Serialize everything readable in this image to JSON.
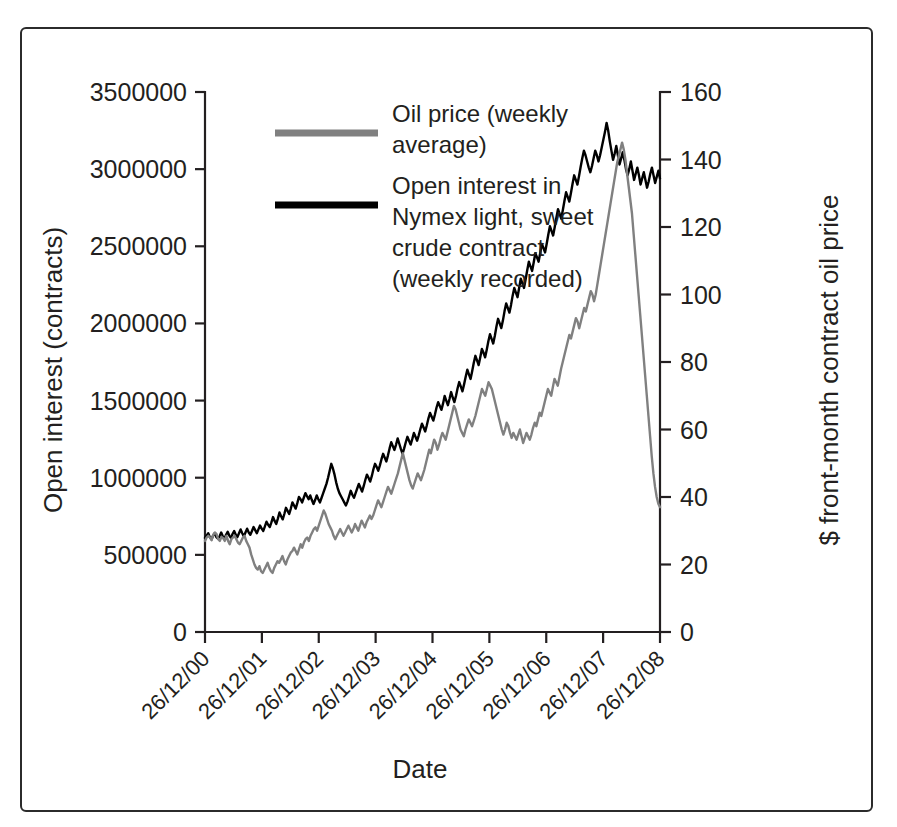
{
  "figure": {
    "background_color": "#ffffff",
    "border_color": "#2b2b2b"
  },
  "chart_data": {
    "type": "line",
    "title": "",
    "xlabel": "Date",
    "ylabel": "Open interest (contracts)",
    "y2label": "$ front-month contract oil price",
    "grid": false,
    "legend_position": "top-center",
    "x_tick_labels": [
      "26/12/00",
      "26/12/01",
      "26/12/02",
      "26/12/03",
      "26/12/04",
      "26/12/05",
      "26/12/06",
      "26/12/07",
      "26/12/08"
    ],
    "x_tick_rotation": -45,
    "xlim": [
      0,
      8
    ],
    "ylim": [
      0,
      3500000
    ],
    "y_ticks": [
      0,
      500000,
      1000000,
      1500000,
      2000000,
      2500000,
      3000000,
      3500000
    ],
    "y_tick_labels": [
      "0",
      "500000",
      "1000000",
      "1500000",
      "2000000",
      "2500000",
      "3000000",
      "3500000"
    ],
    "y2lim": [
      0,
      160
    ],
    "y2_ticks": [
      0,
      20,
      40,
      60,
      80,
      100,
      120,
      140,
      160
    ],
    "y2_tick_labels": [
      "0",
      "20",
      "40",
      "60",
      "80",
      "100",
      "120",
      "140",
      "160"
    ],
    "series": [
      {
        "name": "Oil price (weekly average)",
        "legend_label_lines": [
          "Oil price (weekly",
          "average)"
        ],
        "color": "#808080",
        "axis": "right",
        "units": "$ per barrel",
        "values": [
          27.0,
          28.0,
          28.5,
          28.0,
          27.2,
          28.8,
          29.5,
          29.0,
          27.5,
          27.0,
          28.2,
          27.8,
          27.0,
          28.5,
          27.0,
          26.0,
          27.5,
          28.0,
          28.5,
          27.5,
          26.5,
          26.0,
          27.0,
          28.0,
          28.5,
          27.0,
          26.0,
          25.0,
          23.0,
          21.5,
          20.0,
          19.0,
          18.5,
          19.5,
          18.0,
          17.5,
          18.5,
          19.5,
          20.5,
          19.0,
          18.0,
          17.5,
          19.0,
          20.0,
          21.0,
          20.5,
          21.5,
          22.5,
          21.0,
          20.0,
          21.5,
          22.5,
          23.5,
          24.0,
          25.0,
          24.0,
          23.0,
          24.5,
          26.0,
          25.0,
          26.5,
          27.5,
          28.0,
          27.0,
          28.5,
          29.5,
          30.5,
          31.0,
          30.0,
          31.5,
          33.0,
          34.5,
          36.0,
          35.0,
          33.5,
          32.0,
          31.0,
          30.0,
          28.5,
          27.5,
          28.5,
          29.5,
          30.5,
          29.5,
          28.5,
          29.5,
          30.5,
          31.5,
          30.5,
          29.5,
          30.5,
          32.0,
          31.0,
          30.0,
          31.5,
          33.0,
          32.0,
          31.0,
          32.5,
          33.5,
          34.5,
          33.5,
          34.5,
          36.0,
          37.5,
          39.0,
          38.0,
          37.0,
          38.5,
          40.0,
          41.5,
          43.0,
          42.0,
          41.0,
          42.5,
          44.0,
          45.5,
          47.0,
          49.0,
          51.0,
          53.0,
          51.0,
          49.0,
          47.0,
          45.0,
          43.5,
          42.5,
          44.0,
          45.5,
          47.0,
          46.0,
          45.0,
          46.5,
          48.0,
          50.0,
          52.0,
          54.0,
          53.0,
          55.0,
          57.0,
          56.0,
          54.0,
          55.5,
          57.5,
          59.0,
          58.0,
          57.0,
          59.0,
          61.0,
          63.0,
          65.0,
          67.0,
          66.0,
          64.0,
          62.0,
          60.0,
          59.0,
          58.0,
          60.0,
          61.5,
          63.0,
          62.0,
          61.0,
          62.5,
          64.0,
          66.0,
          68.0,
          70.0,
          72.0,
          71.0,
          70.0,
          72.0,
          74.0,
          73.0,
          72.0,
          70.0,
          68.0,
          66.0,
          64.0,
          62.0,
          60.0,
          58.5,
          60.0,
          62.0,
          61.0,
          59.0,
          57.5,
          59.0,
          58.0,
          57.0,
          58.5,
          60.0,
          58.0,
          56.0,
          57.5,
          59.0,
          58.0,
          57.0,
          58.5,
          60.5,
          62.0,
          61.0,
          63.0,
          65.0,
          64.0,
          66.0,
          68.0,
          70.0,
          72.0,
          71.0,
          70.0,
          72.5,
          75.0,
          74.0,
          73.0,
          75.5,
          78.0,
          80.0,
          82.0,
          84.0,
          86.0,
          88.0,
          87.0,
          89.0,
          91.0,
          93.0,
          92.0,
          90.0,
          92.0,
          94.0,
          96.0,
          95.0,
          97.0,
          99.0,
          101.0,
          100.0,
          98.0,
          100.0,
          103.0,
          106.0,
          109.0,
          112.0,
          115.0,
          118.0,
          121.0,
          124.0,
          127.0,
          130.0,
          133.0,
          136.0,
          139.0,
          141.0,
          143.0,
          145.0,
          143.0,
          140.0,
          136.0,
          132.0,
          128.0,
          124.0,
          118.0,
          112.0,
          106.0,
          100.0,
          94.0,
          88.0,
          82.0,
          76.0,
          70.0,
          64.0,
          58.0,
          52.0,
          47.0,
          43.0,
          40.0,
          38.0,
          37.0
        ]
      },
      {
        "name": "Open interest in Nymex light, sweet crude contract (weekly recorded)",
        "legend_label_lines": [
          "Open interest in",
          "Nymex light, sweet",
          "crude contract",
          "(weekly recorded)"
        ],
        "color": "#000000",
        "axis": "left",
        "units": "contracts",
        "values": [
          610000,
          625000,
          640000,
          615000,
          600000,
          625000,
          640000,
          615000,
          605000,
          620000,
          645000,
          620000,
          605000,
          630000,
          650000,
          625000,
          610000,
          635000,
          655000,
          630000,
          615000,
          640000,
          665000,
          640000,
          620000,
          645000,
          670000,
          645000,
          630000,
          655000,
          680000,
          660000,
          640000,
          665000,
          690000,
          670000,
          655000,
          685000,
          715000,
          695000,
          680000,
          710000,
          745000,
          720000,
          700000,
          735000,
          775000,
          750000,
          730000,
          765000,
          805000,
          785000,
          765000,
          800000,
          840000,
          820000,
          800000,
          835000,
          875000,
          860000,
          840000,
          870000,
          900000,
          880000,
          860000,
          885000,
          855000,
          830000,
          855000,
          885000,
          860000,
          840000,
          870000,
          900000,
          930000,
          960000,
          1000000,
          1045000,
          1090000,
          1060000,
          1020000,
          970000,
          930000,
          900000,
          880000,
          860000,
          840000,
          820000,
          845000,
          880000,
          915000,
          890000,
          870000,
          900000,
          930000,
          960000,
          935000,
          910000,
          945000,
          985000,
          1020000,
          1000000,
          975000,
          1010000,
          1055000,
          1090000,
          1070000,
          1045000,
          1080000,
          1120000,
          1155000,
          1130000,
          1105000,
          1145000,
          1190000,
          1230000,
          1205000,
          1180000,
          1215000,
          1255000,
          1220000,
          1185000,
          1155000,
          1190000,
          1230000,
          1265000,
          1240000,
          1215000,
          1250000,
          1290000,
          1265000,
          1240000,
          1275000,
          1315000,
          1350000,
          1325000,
          1300000,
          1340000,
          1385000,
          1420000,
          1395000,
          1370000,
          1410000,
          1455000,
          1490000,
          1465000,
          1440000,
          1480000,
          1530000,
          1500000,
          1470000,
          1510000,
          1555000,
          1520000,
          1490000,
          1530000,
          1580000,
          1620000,
          1590000,
          1560000,
          1605000,
          1655000,
          1700000,
          1670000,
          1640000,
          1690000,
          1745000,
          1790000,
          1760000,
          1730000,
          1780000,
          1835000,
          1810000,
          1780000,
          1830000,
          1885000,
          1930000,
          1900000,
          1870000,
          1920000,
          1980000,
          2030000,
          2000000,
          1970000,
          2020000,
          2080000,
          2130000,
          2100000,
          2070000,
          2120000,
          2180000,
          2230000,
          2200000,
          2170000,
          2230000,
          2290000,
          2260000,
          2230000,
          2285000,
          2345000,
          2400000,
          2370000,
          2340000,
          2395000,
          2455000,
          2430000,
          2400000,
          2455000,
          2515000,
          2490000,
          2460000,
          2515000,
          2575000,
          2630000,
          2600000,
          2570000,
          2625000,
          2685000,
          2740000,
          2710000,
          2680000,
          2735000,
          2795000,
          2850000,
          2820000,
          2790000,
          2845000,
          2905000,
          2960000,
          2930000,
          2900000,
          2955000,
          3015000,
          3070000,
          3120000,
          3090000,
          3050000,
          3010000,
          2980000,
          3020000,
          3070000,
          3120000,
          3090000,
          3050000,
          3090000,
          3140000,
          3190000,
          3240000,
          3300000,
          3250000,
          3180000,
          3120000,
          3060000,
          3100000,
          3150000,
          3090000,
          3030000,
          3070000,
          3110000,
          3060000,
          3000000,
          2960000,
          3000000,
          3050000,
          2990000,
          2930000,
          2970000,
          3010000,
          2960000,
          2900000,
          2940000,
          2980000,
          2930000,
          2880000,
          2920000,
          2970000,
          3010000,
          2960000,
          2910000,
          2950000,
          2990000,
          2940000
        ]
      }
    ]
  }
}
